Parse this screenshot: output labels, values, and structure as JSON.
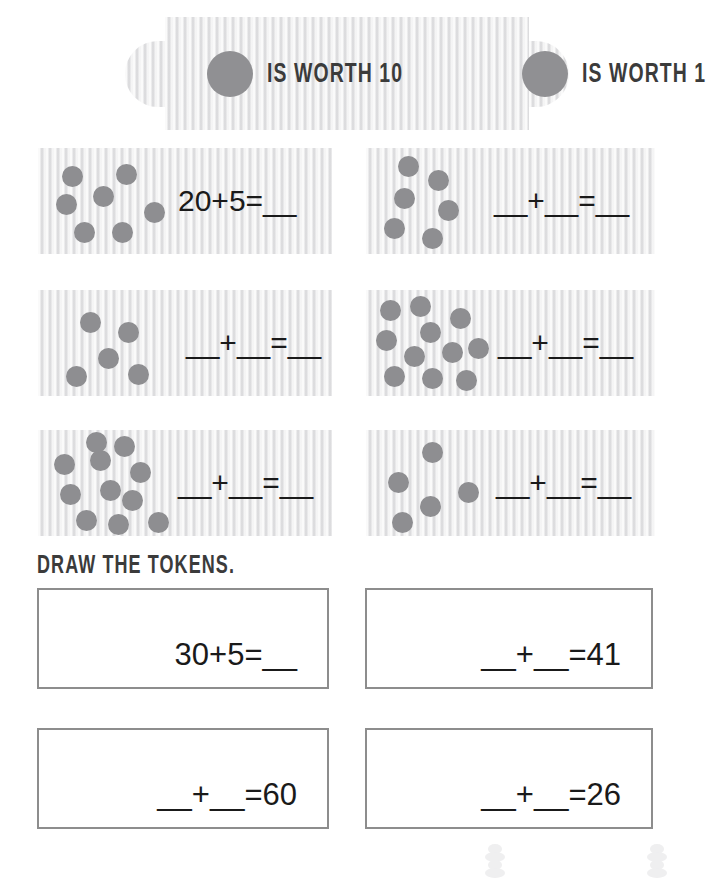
{
  "colors": {
    "token_fill": "#8e8e91",
    "legend_token_fill": "#909093",
    "texture_bg": "#ececed",
    "box_border": "#8d8d8d",
    "text": "#1a1a1a",
    "stencil_text": "#3b3b3b"
  },
  "legend": {
    "items": [
      {
        "icon": "token-circle-icon",
        "label": "IS WORTH 10"
      },
      {
        "icon": "token-circle-icon",
        "label": "IS WORTH 1"
      }
    ]
  },
  "token_banks": [
    {
      "id": "bank-1",
      "equation": "20+5=__",
      "token_count": 7,
      "dots": [
        {
          "x": 24,
          "y": 18
        },
        {
          "x": 78,
          "y": 16
        },
        {
          "x": 18,
          "y": 46
        },
        {
          "x": 55,
          "y": 38
        },
        {
          "x": 106,
          "y": 54
        },
        {
          "x": 36,
          "y": 74
        },
        {
          "x": 74,
          "y": 74
        }
      ]
    },
    {
      "id": "bank-2",
      "equation": "__+__=__",
      "token_count": 6,
      "dots": [
        {
          "x": 32,
          "y": 8
        },
        {
          "x": 62,
          "y": 22
        },
        {
          "x": 28,
          "y": 40
        },
        {
          "x": 72,
          "y": 52
        },
        {
          "x": 18,
          "y": 70
        },
        {
          "x": 56,
          "y": 80
        }
      ]
    },
    {
      "id": "bank-3",
      "equation": "__+__=__",
      "token_count": 5,
      "dots": [
        {
          "x": 42,
          "y": 22
        },
        {
          "x": 80,
          "y": 32
        },
        {
          "x": 60,
          "y": 58
        },
        {
          "x": 28,
          "y": 76
        },
        {
          "x": 90,
          "y": 74
        }
      ]
    },
    {
      "id": "bank-4",
      "equation": "__+__=__",
      "token_count": 11,
      "dots": [
        {
          "x": 14,
          "y": 10
        },
        {
          "x": 44,
          "y": 6
        },
        {
          "x": 84,
          "y": 18
        },
        {
          "x": 54,
          "y": 32
        },
        {
          "x": 10,
          "y": 40
        },
        {
          "x": 38,
          "y": 56
        },
        {
          "x": 76,
          "y": 52
        },
        {
          "x": 102,
          "y": 48
        },
        {
          "x": 18,
          "y": 76
        },
        {
          "x": 56,
          "y": 78
        },
        {
          "x": 90,
          "y": 80
        }
      ]
    },
    {
      "id": "bank-5",
      "equation": "__+__=__",
      "token_count": 11,
      "dots": [
        {
          "x": 16,
          "y": 24
        },
        {
          "x": 52,
          "y": 20
        },
        {
          "x": 76,
          "y": 6
        },
        {
          "x": 92,
          "y": 32
        },
        {
          "x": 22,
          "y": 54
        },
        {
          "x": 62,
          "y": 50
        },
        {
          "x": 84,
          "y": 60
        },
        {
          "x": 38,
          "y": 80
        },
        {
          "x": 70,
          "y": 84
        },
        {
          "x": 110,
          "y": 82
        },
        {
          "x": 48,
          "y": 2
        }
      ]
    },
    {
      "id": "bank-6",
      "equation": "__+__=__",
      "token_count": 5,
      "dots": [
        {
          "x": 56,
          "y": 12
        },
        {
          "x": 22,
          "y": 42
        },
        {
          "x": 54,
          "y": 66
        },
        {
          "x": 92,
          "y": 52
        },
        {
          "x": 26,
          "y": 82
        }
      ]
    }
  ],
  "draw_section": {
    "heading": "DRAW THE TOKENS.",
    "boxes": [
      {
        "id": "draw-box-1",
        "equation": "30+5=__"
      },
      {
        "id": "draw-box-2",
        "equation": "__+__=41"
      },
      {
        "id": "draw-box-3",
        "equation": "__+__=60"
      },
      {
        "id": "draw-box-4",
        "equation": "__+__=26"
      }
    ]
  },
  "decorations": [
    {
      "name": "token-stack-icon"
    },
    {
      "name": "token-stack-icon"
    }
  ]
}
